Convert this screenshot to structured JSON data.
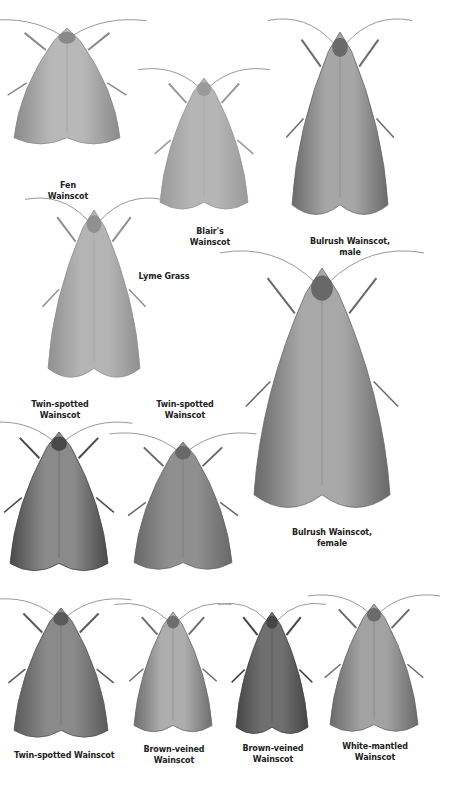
{
  "plate": {
    "colors": {
      "background": "#ffffff",
      "label": "#222222"
    },
    "moths": [
      {
        "id": "fen-wainscot",
        "lines": [
          "Fen",
          "Wainscot"
        ],
        "x": 14,
        "y": 28,
        "w": 106,
        "h": 122,
        "body": "#b8b8b8",
        "edge": "#8a8a8a",
        "label_x": 40,
        "label_y": 180,
        "label_w": 56
      },
      {
        "id": "blairs-wainscot",
        "lines": [
          "Blair's",
          "Wainscot"
        ],
        "x": 160,
        "y": 78,
        "w": 88,
        "h": 138,
        "body": "#b5b5b5",
        "edge": "#9a9a9a",
        "label_x": 180,
        "label_y": 226,
        "label_w": 60
      },
      {
        "id": "bulrush-wainscot-male",
        "lines": [
          "Bulrush Wainscot,",
          "male"
        ],
        "x": 292,
        "y": 32,
        "w": 96,
        "h": 192,
        "body": "#a6a6a6",
        "edge": "#6a6a6a",
        "label_x": 300,
        "label_y": 236,
        "label_w": 100
      },
      {
        "id": "lyme-grass",
        "lines": [
          "Lyme Grass"
        ],
        "x": 48,
        "y": 210,
        "w": 92,
        "h": 176,
        "body": "#b4b4b4",
        "edge": "#909090",
        "label_x": 136,
        "label_y": 271,
        "label_w": 56
      },
      {
        "id": "bulrush-wainscot-female",
        "lines": [
          "Bulrush Wainscot,",
          "female"
        ],
        "x": 254,
        "y": 268,
        "w": 136,
        "h": 252,
        "body": "#a8a8a8",
        "edge": "#686868",
        "label_x": 282,
        "label_y": 527,
        "label_w": 100
      },
      {
        "id": "twin-spotted-wainscot-1",
        "lines": [
          "Twin-spotted",
          "Wainscot"
        ],
        "x": 10,
        "y": 432,
        "w": 98,
        "h": 146,
        "body": "#8a8a8a",
        "edge": "#4a4a4a",
        "label_x": 20,
        "label_y": 399,
        "label_w": 80
      },
      {
        "id": "twin-spotted-wainscot-2",
        "lines": [
          "Twin-spotted",
          "Wainscot"
        ],
        "x": 134,
        "y": 442,
        "w": 98,
        "h": 134,
        "body": "#8f8f8f",
        "edge": "#686868",
        "label_x": 145,
        "label_y": 399,
        "label_w": 80
      },
      {
        "id": "twin-spotted-wainscot-3",
        "lines": [
          "Twin-spotted Wainscot"
        ],
        "x": 14,
        "y": 608,
        "w": 94,
        "h": 136,
        "body": "#8a8a8a",
        "edge": "#5a5a5a",
        "label_x": 14,
        "label_y": 750,
        "label_w": 100
      },
      {
        "id": "brown-veined-wainscot-1",
        "lines": [
          "Brown-veined",
          "Wainscot"
        ],
        "x": 134,
        "y": 612,
        "w": 78,
        "h": 126,
        "body": "#adadad",
        "edge": "#6e6e6e",
        "label_x": 134,
        "label_y": 744,
        "label_w": 80
      },
      {
        "id": "brown-veined-wainscot-2",
        "lines": [
          "Brown-veined",
          "Wainscot"
        ],
        "x": 236,
        "y": 612,
        "w": 72,
        "h": 128,
        "body": "#6f6f6f",
        "edge": "#454545",
        "label_x": 233,
        "label_y": 743,
        "label_w": 80
      },
      {
        "id": "white-mantled-wainscot",
        "lines": [
          "White-mantled",
          "Wainscot"
        ],
        "x": 330,
        "y": 604,
        "w": 88,
        "h": 134,
        "body": "#a2a2a2",
        "edge": "#6a6a6a",
        "label_x": 335,
        "label_y": 741,
        "label_w": 80
      }
    ]
  }
}
